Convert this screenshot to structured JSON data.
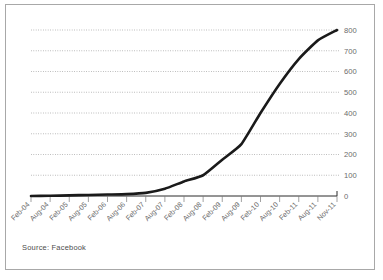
{
  "figure": {
    "source_note": "Source: Facebook",
    "border_color": "#a8a8a8",
    "background": "#ffffff"
  },
  "chart_data": {
    "type": "line",
    "title": "",
    "subtitle": "",
    "xlabel": "",
    "ylabel": "",
    "series_name": "Facebook monthly active users (millions)",
    "line_color": "#1a1a1a",
    "grid": true,
    "grid_axis": "y",
    "legend": "none",
    "y_axis_position": "right",
    "xlim_categories": 17,
    "ylim": [
      0,
      800
    ],
    "yticks": [
      0,
      100,
      200,
      300,
      400,
      500,
      600,
      700,
      800
    ],
    "ytick_labels": [
      "0",
      "100",
      "200",
      "300",
      "400",
      "500",
      "600",
      "700",
      "800"
    ],
    "categories": [
      "Feb-04",
      "Aug-04",
      "Feb-05",
      "Aug-05",
      "Feb-06",
      "Aug-06",
      "Feb-07",
      "Aug-07",
      "Feb-08",
      "Aug-08",
      "Feb-09",
      "Aug-09",
      "Feb-10",
      "Aug-10",
      "Feb-11",
      "Aug-11",
      "Nov-11"
    ],
    "values": [
      0,
      1,
      3,
      5,
      7,
      9,
      15,
      35,
      70,
      100,
      175,
      250,
      400,
      540,
      660,
      750,
      800
    ],
    "xtick_label_rotation": -45
  },
  "axis_text": {
    "y_color": "#6b6b6b",
    "x_color": "#6b6b6b"
  }
}
